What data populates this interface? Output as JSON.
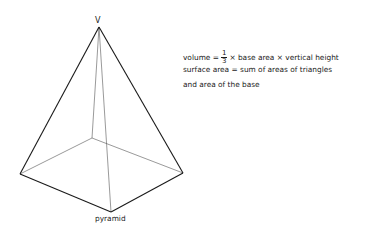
{
  "diagram": {
    "vertex_label": "V",
    "caption": "pyramid",
    "formulas": {
      "volume_prefix": "volume =",
      "fraction_numerator": "1",
      "fraction_denominator": "3",
      "volume_suffix": "× base area × vertical height",
      "surface_line1": "surface area = sum of areas of triangles",
      "surface_line2": "and area of the base"
    },
    "colors": {
      "visible_edge": "#1a1a1a",
      "hidden_edge": "#555555"
    }
  }
}
